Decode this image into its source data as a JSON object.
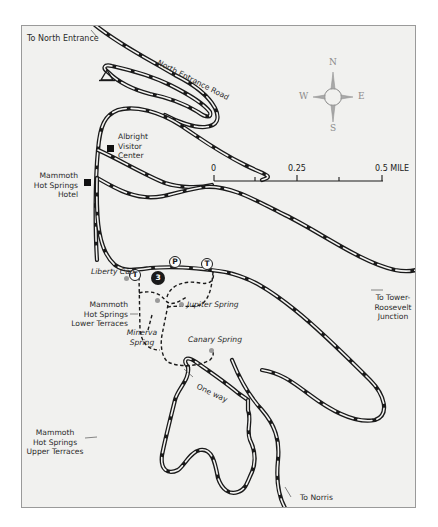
{
  "map": {
    "frame_color": "#f1f1ef",
    "road_color": "#1a1a1a",
    "labels": {
      "to_north_entrance": "To North Entrance",
      "north_entrance_road": "North Entrance Road",
      "albright_visitor_center": [
        "Albright",
        "Visitor",
        "Center"
      ],
      "mammoth_hotel": [
        "Mammoth",
        "Hot Springs",
        "Hotel"
      ],
      "liberty_cap": "Liberty Cap",
      "lower_terraces": [
        "Mammoth",
        "Hot Springs",
        "Lower Terraces"
      ],
      "minerva_spring": [
        "Minerva",
        "Spring"
      ],
      "jupiter_spring": "Jupiter Spring",
      "canary_spring": "Canary Spring",
      "to_tower_roosevelt": [
        "To Tower-",
        "Roosevelt",
        "Junction"
      ],
      "one_way": "One way",
      "upper_terraces": [
        "Mammoth",
        "Hot Springs",
        "Upper Terraces"
      ],
      "to_norris": "To Norris"
    },
    "compass": {
      "n": "N",
      "s": "S",
      "e": "E",
      "w": "W",
      "color": "#8a8a8a"
    },
    "scale_bar": {
      "ticks": [
        "0",
        "0.25",
        "0.5 MILE"
      ]
    },
    "markers": {
      "trailhead_1": "T",
      "parking": "P",
      "trailhead_2": "T",
      "point_number": "3"
    },
    "icons": {
      "campground": "campground-triangle-icon",
      "building": "building-square-icon",
      "spring": "spring-dot-icon"
    }
  }
}
